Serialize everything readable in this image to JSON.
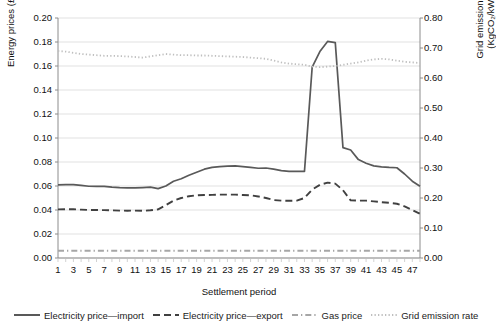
{
  "chart_data": {
    "type": "line",
    "title": "",
    "xlabel": "Settlement period",
    "ylabel": "Energy prices (£/kWh)",
    "ylabel_secondary": "Grid emission rate (KgCO₂/kWh)",
    "x": [
      1,
      2,
      3,
      4,
      5,
      6,
      7,
      8,
      9,
      10,
      11,
      12,
      13,
      14,
      15,
      16,
      17,
      18,
      19,
      20,
      21,
      22,
      23,
      24,
      25,
      26,
      27,
      28,
      29,
      30,
      31,
      32,
      33,
      34,
      35,
      36,
      37,
      38,
      39,
      40,
      41,
      42,
      43,
      44,
      45,
      46,
      47,
      48
    ],
    "xtick_labels": [
      "1",
      "3",
      "5",
      "7",
      "9",
      "11",
      "13",
      "15",
      "17",
      "19",
      "21",
      "23",
      "25",
      "27",
      "29",
      "31",
      "33",
      "35",
      "37",
      "39",
      "41",
      "43",
      "45",
      "47"
    ],
    "ytick_labels_left": [
      "0.00",
      "0.02",
      "0.04",
      "0.06",
      "0.08",
      "0.10",
      "0.12",
      "0.14",
      "0.16",
      "0.18",
      "0.20"
    ],
    "ytick_labels_right": [
      "0.00",
      "0.10",
      "0.20",
      "0.30",
      "0.40",
      "0.50",
      "0.60",
      "0.70",
      "0.80"
    ],
    "ylim": [
      0.0,
      0.2
    ],
    "ylim_secondary": [
      0.0,
      0.8
    ],
    "xlim": [
      1,
      48
    ],
    "grid": true,
    "legend_position": "bottom",
    "series": [
      {
        "name": "Electricity price—import",
        "axis": "left",
        "style": "solid",
        "color": "#595959",
        "values": [
          0.061,
          0.0612,
          0.0611,
          0.0605,
          0.0598,
          0.0597,
          0.0597,
          0.059,
          0.0586,
          0.0585,
          0.0585,
          0.0587,
          0.059,
          0.0578,
          0.06,
          0.064,
          0.066,
          0.069,
          0.0715,
          0.074,
          0.0755,
          0.0762,
          0.0765,
          0.0768,
          0.0762,
          0.0755,
          0.0748,
          0.075,
          0.074,
          0.0728,
          0.0722,
          0.0722,
          0.0722,
          0.159,
          0.172,
          0.1805,
          0.1795,
          0.092,
          0.09,
          0.082,
          0.079,
          0.0768,
          0.076,
          0.0755,
          0.0752,
          0.07,
          0.064,
          0.0598
        ]
      },
      {
        "name": "Electricity price—export",
        "axis": "left",
        "style": "dashed",
        "color": "#404040",
        "values": [
          0.0405,
          0.0406,
          0.0406,
          0.0403,
          0.04,
          0.04,
          0.0399,
          0.0397,
          0.0395,
          0.0394,
          0.0395,
          0.0393,
          0.0398,
          0.0405,
          0.044,
          0.0478,
          0.05,
          0.0515,
          0.0522,
          0.0525,
          0.0526,
          0.0528,
          0.0528,
          0.0528,
          0.0525,
          0.0522,
          0.0513,
          0.05,
          0.0483,
          0.0478,
          0.0477,
          0.0478,
          0.05,
          0.057,
          0.061,
          0.0628,
          0.062,
          0.0565,
          0.048,
          0.0478,
          0.0478,
          0.0472,
          0.0465,
          0.046,
          0.0452,
          0.043,
          0.04,
          0.0368
        ]
      },
      {
        "name": "Gas price",
        "axis": "left",
        "style": "dashdot",
        "color": "#a6a6a6",
        "values": [
          0.006,
          0.006,
          0.006,
          0.006,
          0.006,
          0.006,
          0.006,
          0.006,
          0.006,
          0.006,
          0.006,
          0.006,
          0.006,
          0.006,
          0.006,
          0.006,
          0.006,
          0.006,
          0.006,
          0.006,
          0.006,
          0.006,
          0.006,
          0.006,
          0.006,
          0.006,
          0.006,
          0.006,
          0.006,
          0.006,
          0.006,
          0.006,
          0.006,
          0.006,
          0.006,
          0.006,
          0.006,
          0.006,
          0.006,
          0.006,
          0.006,
          0.006,
          0.006,
          0.006,
          0.006,
          0.006,
          0.006,
          0.006
        ]
      },
      {
        "name": "Grid emission rate",
        "axis": "right",
        "style": "dotted",
        "color": "#bfbfbf",
        "values": [
          0.69,
          0.688,
          0.684,
          0.68,
          0.678,
          0.676,
          0.674,
          0.674,
          0.673,
          0.672,
          0.67,
          0.668,
          0.672,
          0.676,
          0.68,
          0.678,
          0.676,
          0.676,
          0.675,
          0.675,
          0.674,
          0.673,
          0.672,
          0.671,
          0.67,
          0.668,
          0.666,
          0.664,
          0.658,
          0.652,
          0.648,
          0.646,
          0.644,
          0.638,
          0.636,
          0.638,
          0.64,
          0.644,
          0.648,
          0.652,
          0.658,
          0.662,
          0.664,
          0.662,
          0.658,
          0.654,
          0.652,
          0.65
        ]
      }
    ]
  },
  "legend": {
    "items": [
      {
        "label": "Electricity price—import",
        "swatch": "solid-line-swatch"
      },
      {
        "label": "Electricity price—export",
        "swatch": "dashed-line-swatch"
      },
      {
        "label": "Gas price",
        "swatch": "dashdot-line-swatch"
      },
      {
        "label": "Grid emission rate",
        "swatch": "dotted-line-swatch"
      }
    ]
  }
}
